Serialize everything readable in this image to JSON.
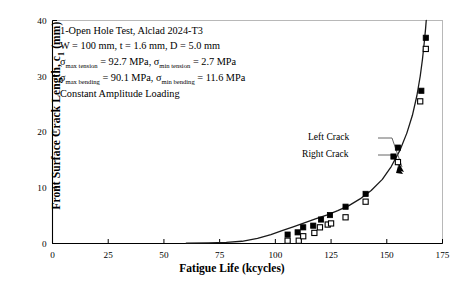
{
  "chart_data": {
    "type": "scatter",
    "title": "",
    "xlabel": "Fatigue Life (kcycles)",
    "ylabel": "Front Surface Crack Length, c",
    "ylabel_sub": "1",
    "ylabel_units": " (mm)",
    "xlim": [
      0,
      175
    ],
    "ylim": [
      0,
      40
    ],
    "xticks": [
      0,
      25,
      50,
      75,
      100,
      125,
      150,
      175
    ],
    "yticks": [
      0,
      10,
      20,
      30,
      40
    ],
    "grid": false,
    "legend_position": "none",
    "series": [
      {
        "name": "Left Crack",
        "marker": "filled-square",
        "points": [
          [
            105.5,
            1.6
          ],
          [
            110.0,
            2.0
          ],
          [
            112.5,
            2.9
          ],
          [
            117.0,
            3.2
          ],
          [
            120.5,
            4.3
          ],
          [
            124.5,
            5.1
          ],
          [
            131.5,
            6.6
          ],
          [
            140.5,
            8.9
          ],
          [
            153.0,
            15.6
          ],
          [
            155.0,
            17.2
          ],
          [
            165.5,
            27.4
          ],
          [
            167.5,
            36.9
          ]
        ]
      },
      {
        "name": "Right Crack",
        "marker": "open-square",
        "points": [
          [
            105.5,
            0.5
          ],
          [
            110.5,
            0.5
          ],
          [
            112.5,
            1.3
          ],
          [
            117.5,
            1.9
          ],
          [
            120.0,
            2.9
          ],
          [
            123.5,
            3.4
          ],
          [
            125.0,
            3.6
          ],
          [
            131.5,
            4.7
          ],
          [
            140.5,
            7.5
          ],
          [
            155.0,
            14.6
          ],
          [
            165.0,
            25.5
          ],
          [
            167.5,
            34.9
          ]
        ]
      }
    ],
    "fit_curve": {
      "name": "analysis-curve",
      "points": [
        [
          60,
          0.05
        ],
        [
          70,
          0.1
        ],
        [
          78,
          0.2
        ],
        [
          85,
          0.4
        ],
        [
          92,
          0.9
        ],
        [
          98,
          1.6
        ],
        [
          103,
          2.3
        ],
        [
          108,
          3.0
        ],
        [
          113,
          3.7
        ],
        [
          118,
          4.4
        ],
        [
          123,
          5.1
        ],
        [
          128,
          5.9
        ],
        [
          133,
          6.8
        ],
        [
          138,
          8.0
        ],
        [
          143,
          9.5
        ],
        [
          148,
          11.5
        ],
        [
          152,
          13.8
        ],
        [
          156,
          16.8
        ],
        [
          159,
          19.8
        ],
        [
          161.5,
          23.0
        ],
        [
          163.5,
          26.5
        ],
        [
          165,
          30.0
        ],
        [
          166,
          33.0
        ],
        [
          166.8,
          36.0
        ],
        [
          167.4,
          38.5
        ],
        [
          167.7,
          40.0
        ]
      ]
    },
    "annotations": {
      "textbox": [
        "1-Open Hole Test, Alclad 2024-T3",
        "W = 100 mm, t = 1.6 mm, D = 5.0 mm",
        "σmax tension = 92.7 MPa, σmin tension = 2.7 MPa",
        "σmax bending = 90.1 MPa, σmin bending = 11.6 MPa",
        "Constant Amplitude Loading"
      ],
      "line1": "1-Open Hole Test, Alclad 2024-T3",
      "line2": "W = 100 mm, t = 1.6 mm, D = 5.0 mm",
      "line3_a": "σ",
      "line3_sub_a": "max tension",
      "line3_b": " = 92.7 MPa, ",
      "line3_c": "σ",
      "line3_sub_c": "min tension",
      "line3_d": " = 2.7 MPa",
      "line4_a": "σ",
      "line4_sub_a": "max bending",
      "line4_b": " = 90.1 MPa, ",
      "line4_c": "σ",
      "line4_sub_c": "min bending",
      "line4_d": " = 11.6 MPa",
      "line5": "Constant Amplitude Loading",
      "point_label_left": "Left Crack",
      "point_label_right": "Right Crack"
    },
    "colors": {
      "axis": "#000000",
      "curve": "#1a1a1a",
      "marker_filled": "#000000",
      "marker_open_fill": "#ffffff",
      "marker_open_stroke": "#000000",
      "background": "#ffffff",
      "frame": "#b0b0b0"
    }
  }
}
